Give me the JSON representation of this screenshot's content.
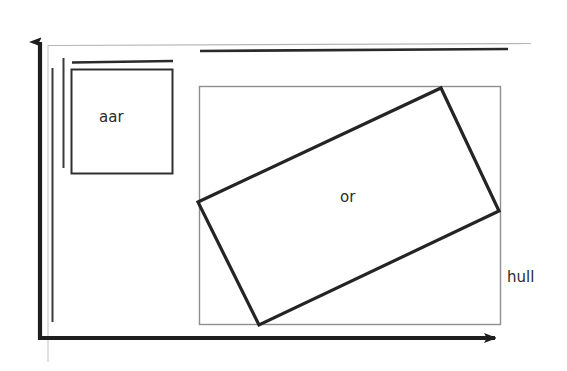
{
  "figure": {
    "type": "geometry-diagram",
    "background_color": "#ffffff",
    "width": 567,
    "height": 371,
    "labels": {
      "aar": "aar",
      "or": "or",
      "hull": "hull"
    },
    "colors": {
      "ink": "#252525",
      "ink_mid": "#3a3a3a",
      "faint_gray": "#b9b9b9",
      "label_text": "#2b2b2b"
    },
    "axes": {
      "name": "coordinate-axes",
      "origin": {
        "x": 40,
        "y": 338
      },
      "y_axis_tip": {
        "x": 40,
        "y": 29
      },
      "x_axis_tip": {
        "x": 508,
        "y": 338
      },
      "stroke_width": 4,
      "arrowheads": 2
    },
    "guides": {
      "faint_vertical": {
        "x": 48,
        "y1": 45,
        "y2": 362
      },
      "faint_horizontal": {
        "x1": 48,
        "y1": 45,
        "x2": 531,
        "y2": 45
      },
      "dark_horizontal_top": {
        "x1": 200,
        "y1": 50,
        "x2": 508,
        "y2": 50
      },
      "dark_vertical_long": {
        "x": 52,
        "y1": 68,
        "y2": 322
      },
      "dark_vertical_short": {
        "x": 63,
        "y1": 58,
        "y2": 168
      },
      "dark_horizontal_aar_top": {
        "x1": 72,
        "y1": 62,
        "x2": 173,
        "y2": 62
      }
    },
    "shapes": [
      {
        "name": "aar-box",
        "kind": "rectangle",
        "label": "aar",
        "x": 71,
        "y": 69,
        "width": 101,
        "height": 104,
        "stroke": "#2f2f2f",
        "stroke_width": 2,
        "fill": "none"
      },
      {
        "name": "hull-box",
        "kind": "rectangle",
        "label": "hull",
        "x": 199,
        "y": 86,
        "width": 302,
        "height": 239,
        "stroke": "#8a8a8a",
        "stroke_width": 1.5,
        "fill": "none"
      },
      {
        "name": "or-rotated-box",
        "kind": "rotated-rectangle",
        "label": "or",
        "points": [
          {
            "x": 198,
            "y": 202
          },
          {
            "x": 441,
            "y": 88
          },
          {
            "x": 499,
            "y": 211
          },
          {
            "x": 259,
            "y": 325
          }
        ],
        "stroke": "#262626",
        "stroke_width": 3.2,
        "fill": "none"
      }
    ]
  }
}
